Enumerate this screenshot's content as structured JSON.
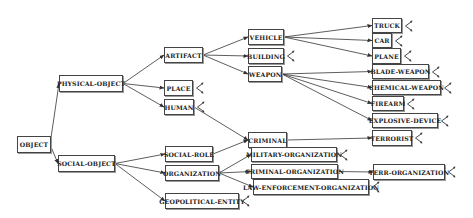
{
  "diagram": {
    "type": "ontology-tree",
    "nodes": [
      {
        "id": "object",
        "label": "OBJECT",
        "x": 17,
        "y": 136,
        "w": 34,
        "h": 17,
        "expand": false
      },
      {
        "id": "physical-object",
        "label": "PHYSICAL-OBJECT",
        "x": 59,
        "y": 75,
        "w": 64,
        "h": 17,
        "expand": false
      },
      {
        "id": "social-object",
        "label": "SOCIAL-OBJECT",
        "x": 58,
        "y": 155,
        "w": 57,
        "h": 17,
        "expand": false
      },
      {
        "id": "artifact",
        "label": "ARTIFACT",
        "x": 164,
        "y": 47,
        "w": 39,
        "h": 16,
        "expand": false
      },
      {
        "id": "place",
        "label": "PLACE",
        "x": 164,
        "y": 80,
        "w": 29,
        "h": 16,
        "expand": true
      },
      {
        "id": "human",
        "label": "HUMAN",
        "x": 164,
        "y": 99,
        "w": 30,
        "h": 16,
        "expand": true
      },
      {
        "id": "social-role",
        "label": "SOCIAL-ROLE",
        "x": 165,
        "y": 146,
        "w": 48,
        "h": 16,
        "expand": false
      },
      {
        "id": "organization",
        "label": "ORGANIZATION",
        "x": 165,
        "y": 165,
        "w": 54,
        "h": 16,
        "expand": false
      },
      {
        "id": "geopolitical-entity",
        "label": "GEOPOLITICAL-ENTITY",
        "x": 165,
        "y": 193,
        "w": 74,
        "h": 16,
        "expand": true
      },
      {
        "id": "vehicle",
        "label": "VEHICLE",
        "x": 248,
        "y": 29,
        "w": 36,
        "h": 16,
        "expand": false
      },
      {
        "id": "building",
        "label": "BUILDING",
        "x": 248,
        "y": 48,
        "w": 36,
        "h": 16,
        "expand": true
      },
      {
        "id": "weapon",
        "label": "WEAPON",
        "x": 248,
        "y": 66,
        "w": 34,
        "h": 16,
        "expand": false
      },
      {
        "id": "criminal",
        "label": "CRIMINAL",
        "x": 248,
        "y": 132,
        "w": 39,
        "h": 16,
        "expand": false
      },
      {
        "id": "military-organization",
        "label": "MILITARY-ORGANIZATION",
        "x": 251,
        "y": 147,
        "w": 86,
        "h": 15,
        "expand": true
      },
      {
        "id": "criminal-organization",
        "label": "CRIMINAL-ORGANIZATION",
        "x": 251,
        "y": 164,
        "w": 87,
        "h": 15,
        "expand": false
      },
      {
        "id": "law-enforcement-organization",
        "label": "LAW-ENFORCEMENT-ORGANIZATION",
        "x": 253,
        "y": 179,
        "w": 116,
        "h": 16,
        "expand": true
      },
      {
        "id": "truck",
        "label": "TRUCK",
        "x": 372,
        "y": 18,
        "w": 30,
        "h": 15,
        "expand": true
      },
      {
        "id": "car",
        "label": "CAR",
        "x": 372,
        "y": 33,
        "w": 20,
        "h": 15,
        "expand": true
      },
      {
        "id": "plane",
        "label": "PLANE",
        "x": 372,
        "y": 48,
        "w": 29,
        "h": 16,
        "expand": true
      },
      {
        "id": "blade-weapon",
        "label": "BLADE-WEAPON",
        "x": 372,
        "y": 64,
        "w": 57,
        "h": 15,
        "expand": true
      },
      {
        "id": "chemical-weapon",
        "label": "CHEMICAL-WEAPON",
        "x": 372,
        "y": 80,
        "w": 69,
        "h": 15,
        "expand": true
      },
      {
        "id": "firearm",
        "label": "FIREARM",
        "x": 372,
        "y": 96,
        "w": 32,
        "h": 15,
        "expand": true
      },
      {
        "id": "explosive-device",
        "label": "EXPLOSIVE-DEVICE",
        "x": 372,
        "y": 113,
        "w": 66,
        "h": 15,
        "expand": true
      },
      {
        "id": "terrorist",
        "label": "TERRORIST",
        "x": 372,
        "y": 130,
        "w": 40,
        "h": 16,
        "expand": true
      },
      {
        "id": "terr-organization",
        "label": "TERR-ORGANIZATION",
        "x": 373,
        "y": 164,
        "w": 72,
        "h": 16,
        "expand": true
      }
    ],
    "edges": [
      {
        "from": "object",
        "to": "physical-object"
      },
      {
        "from": "object",
        "to": "social-object"
      },
      {
        "from": "physical-object",
        "to": "artifact"
      },
      {
        "from": "physical-object",
        "to": "place"
      },
      {
        "from": "physical-object",
        "to": "human"
      },
      {
        "from": "social-object",
        "to": "social-role"
      },
      {
        "from": "social-object",
        "to": "organization"
      },
      {
        "from": "social-object",
        "to": "geopolitical-entity"
      },
      {
        "from": "artifact",
        "to": "vehicle"
      },
      {
        "from": "artifact",
        "to": "building"
      },
      {
        "from": "artifact",
        "to": "weapon"
      },
      {
        "from": "vehicle",
        "to": "truck"
      },
      {
        "from": "vehicle",
        "to": "car"
      },
      {
        "from": "vehicle",
        "to": "plane"
      },
      {
        "from": "weapon",
        "to": "blade-weapon"
      },
      {
        "from": "weapon",
        "to": "chemical-weapon"
      },
      {
        "from": "weapon",
        "to": "firearm"
      },
      {
        "from": "weapon",
        "to": "explosive-device"
      },
      {
        "from": "human",
        "to": "criminal"
      },
      {
        "from": "social-role",
        "to": "criminal"
      },
      {
        "from": "criminal",
        "to": "terrorist"
      },
      {
        "from": "organization",
        "to": "military-organization"
      },
      {
        "from": "organization",
        "to": "criminal-organization"
      },
      {
        "from": "organization",
        "to": "law-enforcement-organization"
      },
      {
        "from": "criminal-organization",
        "to": "terr-organization"
      }
    ],
    "colors": {
      "line": "#333333",
      "border": "#444444",
      "text": "#222222",
      "background": "#ffffff"
    },
    "icons": {
      "expand": "expand-node-icon"
    }
  }
}
